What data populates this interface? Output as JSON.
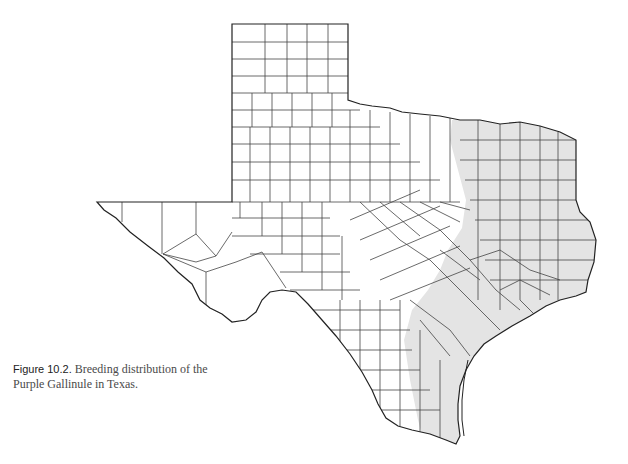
{
  "figure": {
    "label": "Figure 10.2.",
    "caption_line1": " Breeding distribution of the",
    "caption_line2": "Purple Gallinule in Texas."
  },
  "map": {
    "region": "Texas",
    "units": "counties",
    "species": "Purple Gallinule",
    "layer": "Breeding distribution",
    "shaded_area": "Eastern Texas and Gulf Coast",
    "colors": {
      "background": "#ffffff",
      "shaded_range": "#e4e4e4",
      "county_border": "#333333",
      "state_border": "#222222"
    }
  }
}
